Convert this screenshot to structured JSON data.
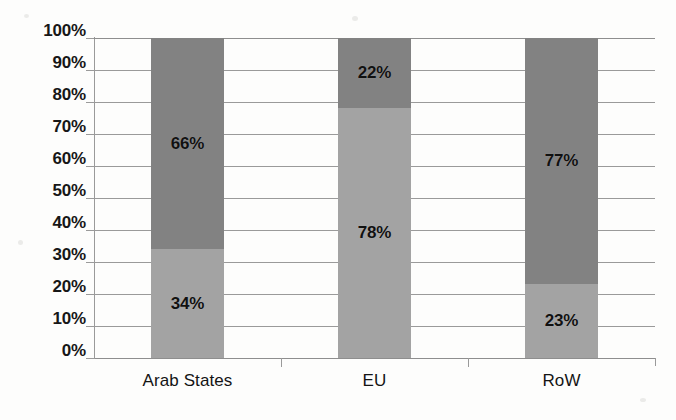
{
  "chart_data": {
    "type": "bar",
    "subtype": "stacked-100-percent",
    "title": "",
    "subtitle": "",
    "xlabel": "",
    "ylabel": "",
    "categories": [
      "Arab States",
      "EU",
      "RoW"
    ],
    "series": [
      {
        "name": "lower-segment",
        "color": "#a3a3a3",
        "values": [
          34,
          78,
          23
        ],
        "labels": [
          "34%",
          "78%",
          "23%"
        ]
      },
      {
        "name": "upper-segment",
        "color": "#828282",
        "values": [
          66,
          22,
          77
        ],
        "labels": [
          "66%",
          "22%",
          "77%"
        ]
      }
    ],
    "ylim": [
      0,
      100
    ],
    "y_tick_values": [
      100,
      90,
      80,
      70,
      60,
      50,
      40,
      30,
      20,
      10,
      0
    ],
    "y_tick_labels": [
      "100%",
      "90%",
      "80%",
      "70%",
      "60%",
      "50%",
      "40%",
      "30%",
      "20%",
      "10%",
      "0%"
    ],
    "grid": true,
    "grid_orientation": "horizontal",
    "legend": false,
    "legend_position": "none",
    "value_labels_shown": true
  },
  "colors": {
    "lower_segment": "#a3a3a3",
    "upper_segment": "#828282",
    "gridline": "#9a9a9a",
    "axis": "#8e8e8e",
    "text": "#171717",
    "background": "#fdfdfc"
  },
  "axis": {
    "y_ticks": [
      {
        "label": "100%",
        "value": 100
      },
      {
        "label": "90%",
        "value": 90
      },
      {
        "label": "80%",
        "value": 80
      },
      {
        "label": "70%",
        "value": 70
      },
      {
        "label": "60%",
        "value": 60
      },
      {
        "label": "50%",
        "value": 50
      },
      {
        "label": "40%",
        "value": 40
      },
      {
        "label": "30%",
        "value": 30
      },
      {
        "label": "20%",
        "value": 20
      },
      {
        "label": "10%",
        "value": 10
      },
      {
        "label": "0%",
        "value": 0
      }
    ],
    "x_categories": [
      {
        "label": "Arab States"
      },
      {
        "label": "EU"
      },
      {
        "label": "RoW"
      }
    ]
  },
  "bars": [
    {
      "category": "Arab States",
      "lower": {
        "value": 34,
        "label": "34%"
      },
      "upper": {
        "value": 66,
        "label": "66%"
      }
    },
    {
      "category": "EU",
      "lower": {
        "value": 78,
        "label": "78%"
      },
      "upper": {
        "value": 22,
        "label": "22%"
      }
    },
    {
      "category": "RoW",
      "lower": {
        "value": 23,
        "label": "23%"
      },
      "upper": {
        "value": 77,
        "label": "77%"
      }
    }
  ]
}
